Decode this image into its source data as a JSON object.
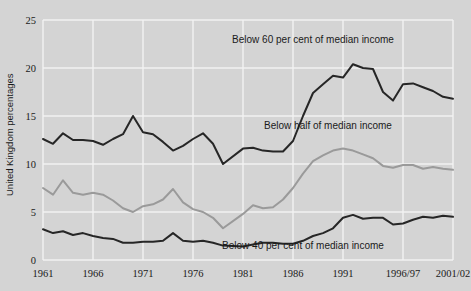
{
  "chart_data": {
    "type": "line",
    "title": "",
    "subtitle": "",
    "xlabel": "",
    "ylabel": "United Kingdom percentages",
    "ylim": [
      0,
      25
    ],
    "yticks": [
      0,
      5,
      10,
      15,
      20,
      25
    ],
    "ytick_labels": [
      "0",
      "5",
      "10",
      "15",
      "20",
      "25"
    ],
    "xtick_labels": [
      "1961",
      "1966",
      "1971",
      "1976",
      "1981",
      "1986",
      "1991",
      "1996/97",
      "2001/02"
    ],
    "xtick_values": [
      1961,
      1966,
      1971,
      1976,
      1981,
      1986,
      1991,
      1997,
      2002
    ],
    "grid": true,
    "grid_color": "#f2f2f2",
    "background": "#d4d4d4",
    "legend_position": "inline-annotations",
    "x": [
      1961,
      1962,
      1963,
      1964,
      1965,
      1966,
      1967,
      1968,
      1969,
      1970,
      1971,
      1972,
      1973,
      1974,
      1975,
      1976,
      1977,
      1978,
      1979,
      1981,
      1982,
      1983,
      1984,
      1985,
      1986,
      1987,
      1988,
      1989,
      1990,
      1991,
      1992,
      1993,
      1994,
      1995,
      1996,
      1997,
      1998,
      1999,
      2000,
      2001,
      2002
    ],
    "series": [
      {
        "name": "Below 60 per cent of median income",
        "color": "#262626",
        "width": 2.0,
        "label_x": 1988.0,
        "label_y": 22.6,
        "values": [
          12.6,
          12.1,
          13.2,
          12.5,
          12.5,
          12.4,
          12.0,
          12.6,
          13.1,
          15.0,
          13.3,
          13.1,
          12.3,
          11.4,
          11.9,
          12.6,
          13.2,
          12.1,
          10.0,
          11.6,
          11.7,
          11.4,
          11.3,
          11.3,
          12.4,
          15.0,
          17.4,
          18.3,
          19.2,
          19.0,
          20.4,
          20.0,
          19.9,
          17.5,
          16.6,
          18.3,
          18.4,
          18.0,
          17.6,
          17.0,
          16.8
        ]
      },
      {
        "name": "Below half of median income",
        "color": "#9a9a9a",
        "width": 2.0,
        "label_x": 1989.5,
        "label_y": 13.6,
        "values": [
          7.5,
          6.8,
          8.3,
          7.0,
          6.8,
          7.0,
          6.8,
          6.2,
          5.4,
          5.0,
          5.6,
          5.8,
          6.3,
          7.4,
          6.0,
          5.3,
          5.0,
          4.4,
          3.3,
          4.8,
          5.7,
          5.4,
          5.5,
          6.3,
          7.5,
          9.0,
          10.3,
          10.9,
          11.4,
          11.6,
          11.4,
          11.0,
          10.6,
          9.8,
          9.6,
          9.9,
          9.9,
          9.5,
          9.7,
          9.5,
          9.4
        ]
      },
      {
        "name": "Below 40 per cent of median income",
        "color": "#262626",
        "width": 2.0,
        "label_x": 1987.0,
        "label_y": 1.1,
        "values": [
          3.2,
          2.8,
          3.0,
          2.6,
          2.8,
          2.5,
          2.3,
          2.2,
          1.8,
          1.8,
          1.9,
          1.9,
          2.0,
          2.8,
          2.0,
          1.9,
          2.0,
          1.8,
          1.5,
          1.4,
          1.6,
          1.8,
          1.8,
          1.7,
          1.7,
          2.0,
          2.5,
          2.8,
          3.3,
          4.4,
          4.7,
          4.3,
          4.4,
          4.4,
          3.7,
          3.8,
          4.2,
          4.5,
          4.4,
          4.6,
          4.5
        ]
      }
    ]
  },
  "axis": {
    "ylabel": "United Kingdom percentages"
  }
}
